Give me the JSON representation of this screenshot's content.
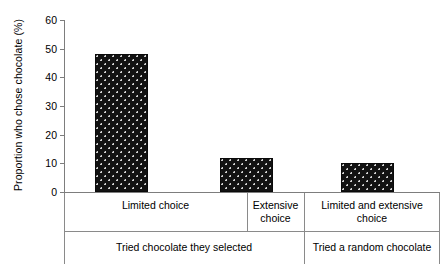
{
  "chart_data": {
    "type": "bar",
    "title": "",
    "xlabel": "",
    "ylabel": "Proportion who chose chocolate (%)",
    "ylim": [
      0,
      60
    ],
    "yticks": [
      0,
      10,
      20,
      30,
      40,
      50,
      60
    ],
    "grid": false,
    "legend": null,
    "categories": [
      "Limited choice",
      "Extensive choice",
      "Limited and extensive choice"
    ],
    "values": [
      48,
      12,
      10
    ],
    "group_labels": [
      "Tried chocolate they selected",
      "Tried a random chocolate"
    ],
    "groups": [
      {
        "label": "Tried chocolate they selected",
        "categories": [
          "Limited choice",
          "Extensive choice"
        ]
      },
      {
        "label": "Tried a random chocolate",
        "categories": [
          "Limited and extensive choice"
        ]
      }
    ],
    "bar_color": "#121212",
    "bar_pattern": "dotted-speckle",
    "axis_color": "#7d7d7d"
  }
}
